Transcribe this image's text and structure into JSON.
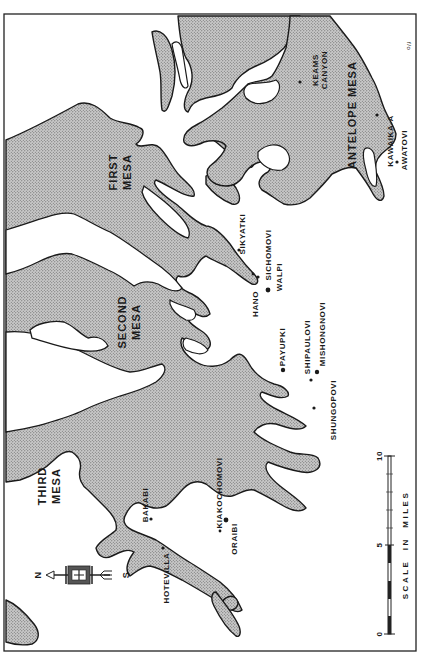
{
  "map": {
    "title": "Hopi Mesas",
    "orientation": "rotated 90 degrees; north points left",
    "corner_mark": "f/o",
    "colors": {
      "mesa_fill": "#b8b8b8",
      "outline": "#1a1a1a",
      "background": "#ffffff"
    },
    "mesas": [
      {
        "name": "FIRST",
        "line2": "MESA"
      },
      {
        "name": "SECOND",
        "line2": "MESA"
      },
      {
        "name": "THIRD",
        "line2": "MESA"
      },
      {
        "name": "ANTELOPE MESA"
      }
    ],
    "villages": [
      {
        "name": "KEAMS",
        "line2": "CANYON"
      },
      {
        "name": "KAWAIKA-A"
      },
      {
        "name": "AWATOVI"
      },
      {
        "name": "SIKYATKI"
      },
      {
        "name": "SICHOMOVI"
      },
      {
        "name": "WALPI"
      },
      {
        "name": "HANO"
      },
      {
        "name": "PAYUPKI"
      },
      {
        "name": "SHIPAULOVI"
      },
      {
        "name": "MISHONGNOVI"
      },
      {
        "name": "SHUNGOPOVI"
      },
      {
        "name": "KIAKOCHOMOVI"
      },
      {
        "name": "ORAIBI"
      },
      {
        "name": "BAKABI"
      },
      {
        "name": "HOTEVILLA"
      }
    ],
    "compass": {
      "north": "N",
      "south": "S",
      "icon": "compass-arrow-icon"
    },
    "scale": {
      "title": "SCALE  IN  MILES",
      "ticks": [
        "0",
        "5",
        "10"
      ]
    }
  }
}
